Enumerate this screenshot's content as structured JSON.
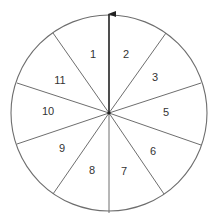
{
  "diagram": {
    "type": "spinner",
    "center": [
      109,
      113
    ],
    "radius": 98,
    "colors": {
      "line": "#6e6e6e",
      "pointer": "#222222",
      "text": "#333333"
    },
    "pointer": {
      "direction": "up",
      "tip": [
        109,
        13
      ]
    },
    "spokes": [
      [
        109,
        213
      ],
      [
        53,
        33
      ],
      [
        166,
        33
      ],
      [
        17,
        83
      ],
      [
        201,
        83
      ],
      [
        17,
        144
      ],
      [
        201,
        145
      ],
      [
        53,
        194
      ],
      [
        164,
        194
      ]
    ],
    "sectors": [
      {
        "label": "1",
        "x": 93,
        "y": 55
      },
      {
        "label": "2",
        "x": 126,
        "y": 55
      },
      {
        "label": "3",
        "x": 155,
        "y": 78
      },
      {
        "label": "5",
        "x": 166,
        "y": 113
      },
      {
        "label": "6",
        "x": 153,
        "y": 152
      },
      {
        "label": "7",
        "x": 124,
        "y": 172
      },
      {
        "label": "8",
        "x": 92,
        "y": 171
      },
      {
        "label": "9",
        "x": 62,
        "y": 149
      },
      {
        "label": "10",
        "x": 48,
        "y": 112
      },
      {
        "label": "11",
        "x": 60,
        "y": 81
      }
    ]
  }
}
